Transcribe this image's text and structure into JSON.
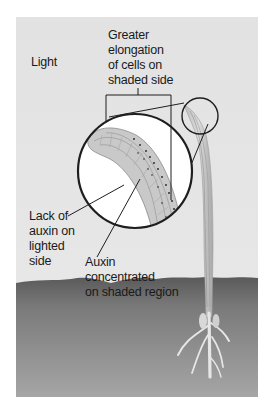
{
  "figure": {
    "labels": {
      "light": "Light",
      "elongation": [
        "Greater",
        "elongation",
        "of cells on",
        "shaded side"
      ],
      "lack_auxin": [
        "Lack of",
        "auxin on",
        "lighted",
        "side"
      ],
      "auxin_concentrated": [
        "Auxin",
        "concentrated",
        "on shaded region"
      ]
    },
    "colors": {
      "background": "#e4e4e4",
      "soil": "#8a8a8a",
      "soil_dark": "#5e5e5e",
      "plant": "#d2d2d2",
      "outline": "#1e1e1e",
      "circle_fill": "#ffffff"
    }
  }
}
